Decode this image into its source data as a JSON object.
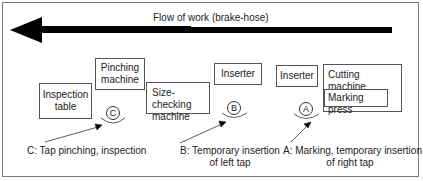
{
  "diagram": {
    "flow_label": "Flow of work (brake-hose)",
    "stations": {
      "inspection_table": "Inspection\ntable",
      "pinching_machine": "Pinching\nmachine",
      "size_checking_machine": "Size-checking\nmachine",
      "inserter_b": "Inserter",
      "inserter_a": "Inserter",
      "cutting_machine": "Cutting machine",
      "marking_press": "Marking press"
    },
    "operators": {
      "c": "C",
      "b": "B",
      "a": "A"
    },
    "captions": {
      "c": "C:  Tap pinching, inspection",
      "b_line1": "B: Temporary insertion",
      "b_line2": "of left tap",
      "a_line1": "A: Marking, temporary insertion",
      "a_line2": "of right tap"
    }
  }
}
